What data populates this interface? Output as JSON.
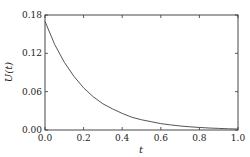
{
  "chart_data": {
    "type": "line",
    "title": "",
    "xlabel": "t",
    "ylabel": "U(t)",
    "xlim": [
      0.0,
      1.0
    ],
    "ylim": [
      0.0,
      0.18
    ],
    "xticks": [
      "0.0",
      "0.2",
      "0.4",
      "0.6",
      "0.8",
      "1.0"
    ],
    "yticks": [
      "0.00",
      "0.06",
      "0.12",
      "0.18"
    ],
    "grid": false,
    "legend": null,
    "series": [
      {
        "name": "U(t)",
        "color": "#555555",
        "x": [
          0.0,
          0.05,
          0.1,
          0.15,
          0.2,
          0.25,
          0.3,
          0.35,
          0.4,
          0.45,
          0.5,
          0.55,
          0.6,
          0.65,
          0.7,
          0.75,
          0.8,
          0.85,
          0.9,
          0.95,
          1.0
        ],
        "y": [
          0.17,
          0.134,
          0.106,
          0.084,
          0.066,
          0.052,
          0.041,
          0.033,
          0.026,
          0.02,
          0.016,
          0.013,
          0.01,
          0.008,
          0.0063,
          0.005,
          0.004,
          0.0031,
          0.0025,
          0.0019,
          0.0015
        ]
      }
    ]
  }
}
